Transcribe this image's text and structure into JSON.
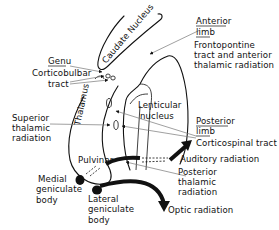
{
  "diagram": {
    "structures": {
      "caudate": "Caudate Nucleus",
      "thalamus": "Thalamus",
      "lenticular_1": "Lenticular",
      "lenticular_2": "nucleus",
      "pulvinar": "Pulvinar"
    },
    "labels": {
      "anterior_limb_1": "Anterior",
      "anterior_limb_2": "limb",
      "frontopontine_1": "Frontopontine",
      "frontopontine_2": "tract and anterior",
      "frontopontine_3": "thalamic radiation",
      "genu": "Genu",
      "corticobulbar_1": "Corticobulbar",
      "corticobulbar_2": "tract",
      "superior_thalamic_1": "Superior",
      "superior_thalamic_2": "thalamic",
      "superior_thalamic_3": "radiation",
      "posterior_limb_1": "Posterior",
      "posterior_limb_2": "limb",
      "corticospinal": "Corticospinal tract",
      "auditory": "Auditory radiation",
      "posterior_thalamic_1": "Posterior",
      "posterior_thalamic_2": "thalamic",
      "posterior_thalamic_3": "radiation",
      "medial_geniculate_1": "Medial",
      "medial_geniculate_2": "geniculate",
      "medial_geniculate_3": "body",
      "lateral_geniculate_1": "Lateral",
      "lateral_geniculate_2": "geniculate",
      "lateral_geniculate_3": "body",
      "optic": "Optic radiation"
    },
    "colors": {
      "line": "#111111",
      "leader": "#777777",
      "background": "#ffffff"
    }
  }
}
